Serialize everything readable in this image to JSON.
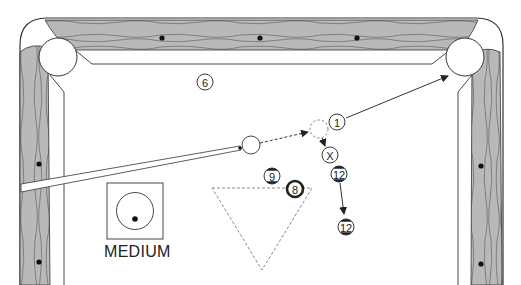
{
  "diagram": {
    "type": "pool-table-shot-diagram",
    "colors": {
      "rail_wood": "#b9b9b9",
      "rail_grain": "#555555",
      "outline": "#333333",
      "felt": "#ffffff",
      "diamond": "#111111",
      "path": "#333333",
      "dashed": "#888888"
    },
    "diamonds_top": [
      {
        "x": 162,
        "y": 38
      },
      {
        "x": 260,
        "y": 38
      },
      {
        "x": 357,
        "y": 38
      }
    ],
    "diamonds_left": [
      {
        "x": 39,
        "y": 164
      },
      {
        "x": 39,
        "y": 262
      }
    ],
    "diamonds_right": [
      {
        "x": 481,
        "y": 166
      },
      {
        "x": 481,
        "y": 264
      }
    ],
    "pockets": [
      {
        "name": "top-left-pocket",
        "x": 58,
        "y": 57,
        "r": 19
      },
      {
        "name": "top-right-pocket",
        "x": 465,
        "y": 57,
        "r": 19
      }
    ],
    "balls": [
      {
        "name": "ball-6",
        "label": "6",
        "x": 205,
        "y": 82,
        "stripe": false
      },
      {
        "name": "ball-1",
        "label": "1",
        "x": 337,
        "y": 122,
        "stripe": false
      },
      {
        "name": "ball-x",
        "label": "X",
        "x": 330,
        "y": 155,
        "stripe": false
      },
      {
        "name": "ball-12-start",
        "label": "12",
        "x": 339,
        "y": 174,
        "stripe": true
      },
      {
        "name": "ball-9",
        "label": "9",
        "x": 272,
        "y": 176,
        "stripe": true
      },
      {
        "name": "ball-8",
        "label": "8",
        "x": 295,
        "y": 189,
        "stripe": false,
        "solid_ring": true
      },
      {
        "name": "ball-12-end",
        "label": "12",
        "x": 346,
        "y": 227,
        "stripe": true
      }
    ],
    "cue_ball": {
      "x": 251,
      "y": 145,
      "r": 9
    },
    "ghost_ball": {
      "x": 319,
      "y": 129,
      "r": 9
    },
    "legend": {
      "label": "MEDIUM",
      "box": {
        "x": 107,
        "y": 183,
        "w": 56,
        "h": 56
      }
    }
  }
}
